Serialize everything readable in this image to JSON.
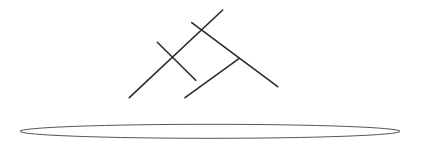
{
  "diagram": {
    "width": 422,
    "height": 144,
    "background": "#ffffff",
    "stroke_color": "#2b2b2b",
    "ellipse_stroke_color": "#555555",
    "lines": [
      {
        "x1": 129.3,
        "y1": 97.7,
        "x2": 222.7,
        "y2": 10.0
      },
      {
        "x1": 157.3,
        "y1": 42.3,
        "x2": 195.7,
        "y2": 80.3
      },
      {
        "x1": 191.7,
        "y1": 22.7,
        "x2": 277.7,
        "y2": 86.7
      },
      {
        "x1": 185.0,
        "y1": 97.7,
        "x2": 239.3,
        "y2": 58.3
      }
    ],
    "ellipse": {
      "cx": 210,
      "cy": 131.3,
      "rx": 190,
      "ry": 7
    }
  }
}
